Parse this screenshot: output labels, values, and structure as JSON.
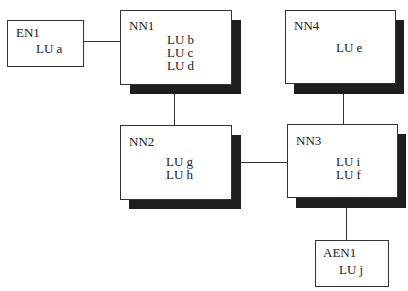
{
  "diagram": {
    "type": "network-topology",
    "nodes": [
      {
        "id": "EN1",
        "name": "EN1",
        "lus": [
          "LU a"
        ],
        "shadow": false
      },
      {
        "id": "NN1",
        "name": "NN1",
        "lus": [
          "LU b",
          "LU c",
          "LU d"
        ],
        "shadow": true
      },
      {
        "id": "NN4",
        "name": "NN4",
        "lus": [
          "LU e"
        ],
        "shadow": true
      },
      {
        "id": "NN2",
        "name": "NN2",
        "lus": [
          "LU g",
          "LU h"
        ],
        "shadow": true
      },
      {
        "id": "NN3",
        "name": "NN3",
        "lus": [
          "LU i",
          "LU f"
        ],
        "shadow": true
      },
      {
        "id": "AEN1",
        "name": "AEN1",
        "lus": [
          "LU j"
        ],
        "shadow": false
      }
    ],
    "edges": [
      [
        "EN1",
        "NN1"
      ],
      [
        "NN1",
        "NN2"
      ],
      [
        "NN4",
        "NN3"
      ],
      [
        "NN2",
        "NN3"
      ],
      [
        "NN3",
        "AEN1"
      ]
    ],
    "colors": {
      "box_border": "#333333",
      "shadow": "#1e1e1e",
      "line": "#333333",
      "background": "#ffffff"
    }
  }
}
